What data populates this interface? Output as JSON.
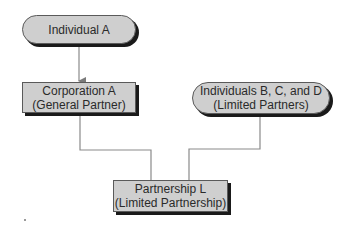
{
  "diagram": {
    "type": "ownership-structure",
    "nodes": [
      {
        "id": "individual-a",
        "shape": "rounded-pill",
        "lines": [
          "Individual A"
        ]
      },
      {
        "id": "corporation-a",
        "shape": "rectangle",
        "lines": [
          "Corporation A",
          "(General Partner)"
        ]
      },
      {
        "id": "individuals-bcd",
        "shape": "rounded-pill",
        "lines": [
          "Individuals B, C, and D",
          "(Limited Partners)"
        ]
      },
      {
        "id": "partnership-l",
        "shape": "rectangle",
        "lines": [
          "Partnership L",
          "(Limited Partnership)"
        ]
      }
    ],
    "edges": [
      {
        "from": "individual-a",
        "to": "corporation-a",
        "style": "arrow"
      },
      {
        "from": "corporation-a",
        "to": "partnership-l",
        "style": "elbow-line"
      },
      {
        "from": "individuals-bcd",
        "to": "partnership-l",
        "style": "elbow-line"
      }
    ],
    "colors": {
      "node_fill": "#cfcfcf",
      "node_border": "#5a5a5a",
      "node_shadow": "#1a1a1a",
      "connector": "#8a8a8a",
      "text": "#2a2a2a"
    }
  }
}
